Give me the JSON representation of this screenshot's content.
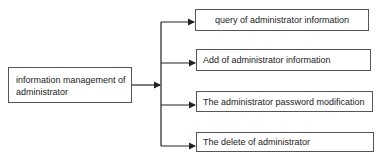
{
  "diagram": {
    "root": {
      "label": "information management of administrator"
    },
    "children": [
      {
        "label": "query of administrator information"
      },
      {
        "label": "Add of administrator information"
      },
      {
        "label": "The administrator password modification"
      },
      {
        "label": "The delete of administrator"
      }
    ],
    "colors": {
      "line": "#222222",
      "border": "#555555"
    }
  }
}
